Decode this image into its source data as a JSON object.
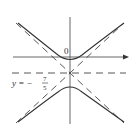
{
  "diagram": {
    "type": "hyperbola",
    "origin_label": "0",
    "asymptote_label": {
      "prefix": "y = −",
      "numerator": "7",
      "denominator": "5"
    },
    "center": {
      "x": 0,
      "y": -1.4
    },
    "colors": {
      "curve": "#333333",
      "axis": "#555555",
      "dashed": "#444444",
      "background": "#ffffff"
    }
  }
}
